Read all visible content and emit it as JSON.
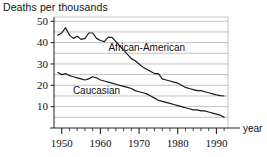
{
  "chart_data": {
    "type": "line",
    "title": "Deaths per thousands",
    "xlabel": "year",
    "ylabel": "",
    "xlim": [
      1948,
      1993
    ],
    "ylim": [
      0,
      52
    ],
    "grid": true,
    "grid_interval": 5,
    "legend_position": "inline-annotation",
    "x_ticks_major": [
      1950,
      1960,
      1970,
      1980,
      1990
    ],
    "x_ticks_major_labels": [
      "1950",
      "1960",
      "1970",
      "1980",
      "1990"
    ],
    "x_tick_minor_interval": 2,
    "y_ticks": [
      10,
      20,
      30,
      40,
      50
    ],
    "y_tick_labels": [
      "10",
      "20",
      "30",
      "40",
      "50"
    ],
    "annotations": [
      {
        "text": "African-American",
        "x": 1972,
        "y": 36
      },
      {
        "text": "Caucasian",
        "x": 1959,
        "y": 16
      }
    ],
    "series": [
      {
        "name": "African-American",
        "color": "#1a1a1a",
        "x": [
          1949,
          1950,
          1951,
          1952,
          1953,
          1954,
          1955,
          1956,
          1957,
          1958,
          1959,
          1960,
          1961,
          1962,
          1963,
          1964,
          1965,
          1966,
          1967,
          1968,
          1969,
          1970,
          1971,
          1972,
          1973,
          1974,
          1975,
          1976,
          1977,
          1978,
          1979,
          1980,
          1981,
          1982,
          1983,
          1984,
          1985,
          1986,
          1987,
          1988,
          1989,
          1990,
          1991,
          1992
        ],
        "values": [
          43.5,
          44.5,
          47.0,
          43.5,
          42.0,
          43.0,
          41.5,
          42.0,
          44.5,
          44.5,
          42.0,
          41.0,
          40.5,
          42.5,
          42.5,
          40.5,
          38.5,
          36.5,
          34.5,
          32.5,
          31.5,
          30.0,
          28.5,
          27.5,
          26.5,
          25.5,
          25.5,
          23.0,
          22.5,
          22.0,
          21.5,
          21.0,
          20.0,
          19.0,
          18.5,
          18.0,
          17.5,
          17.5,
          17.0,
          16.5,
          16.0,
          15.5,
          15.2,
          15.0
        ]
      },
      {
        "name": "Caucasian",
        "color": "#1a1a1a",
        "x": [
          1949,
          1950,
          1951,
          1952,
          1953,
          1954,
          1955,
          1956,
          1957,
          1958,
          1959,
          1960,
          1961,
          1962,
          1963,
          1964,
          1965,
          1966,
          1967,
          1968,
          1969,
          1970,
          1971,
          1972,
          1973,
          1974,
          1975,
          1976,
          1977,
          1978,
          1979,
          1980,
          1981,
          1982,
          1983,
          1984,
          1985,
          1986,
          1987,
          1988,
          1989,
          1990,
          1991,
          1992
        ],
        "values": [
          26.0,
          25.0,
          25.5,
          24.5,
          24.0,
          23.5,
          23.0,
          22.5,
          23.0,
          24.0,
          23.5,
          22.5,
          22.0,
          21.5,
          21.0,
          20.5,
          20.0,
          19.5,
          19.0,
          18.5,
          17.5,
          17.0,
          16.5,
          16.0,
          15.0,
          14.0,
          13.0,
          12.5,
          12.0,
          11.5,
          11.0,
          10.5,
          10.0,
          9.5,
          9.0,
          8.5,
          8.5,
          8.0,
          8.0,
          7.5,
          7.0,
          6.5,
          6.0,
          5.0
        ]
      }
    ]
  },
  "chart": {
    "title": "Deaths per thousands",
    "axis_x_name": "year"
  }
}
